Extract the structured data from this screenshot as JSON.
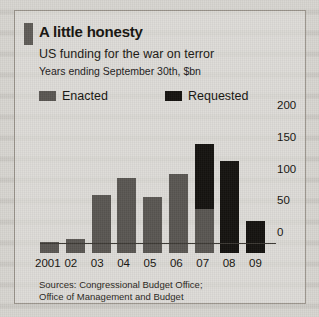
{
  "figure": {
    "title": "A little honesty",
    "subtitle": "US funding for the war on terror",
    "units_note": "Years ending September 30th, $bn",
    "source_line_1": "Sources: Congressional Budget Office;",
    "source_line_2": "Office of Management and Budget",
    "colors": {
      "enacted": "#5a5753",
      "requested": "#151310",
      "panel_background": "#e2e0db",
      "page_background": "#d8d6d1",
      "axis": "#3a3732",
      "text": "#16140f",
      "title_accent": "#5f5c58"
    }
  },
  "legend": {
    "position": "top-left",
    "items": [
      {
        "label": "Enacted",
        "color": "#5a5753",
        "swatch_icon": "legend-swatch-enacted"
      },
      {
        "label": "Requested",
        "color": "#151310",
        "swatch_icon": "legend-swatch-requested"
      }
    ]
  },
  "chart_data": {
    "type": "bar",
    "title": "A little honesty",
    "subtitle": "US funding for the war on terror",
    "xlabel": "",
    "ylabel": "$bn",
    "ylim": [
      0,
      200
    ],
    "yticks": [
      0,
      50,
      100,
      150,
      200
    ],
    "ytick_labels": [
      "0",
      "50",
      "100",
      "150",
      "200"
    ],
    "y_axis_side": "right",
    "grid": false,
    "stacked": true,
    "categories": [
      "2001",
      "02",
      "03",
      "04",
      "05",
      "06",
      "07",
      "08",
      "09"
    ],
    "series": [
      {
        "name": "Enacted",
        "color": "#5a5753",
        "values": [
          17,
          22,
          92,
          118,
          88,
          125,
          70,
          0,
          0
        ]
      },
      {
        "name": "Requested",
        "color": "#151310",
        "values": [
          0,
          0,
          0,
          0,
          0,
          0,
          102,
          145,
          50
        ]
      }
    ],
    "totals": [
      17,
      22,
      92,
      118,
      88,
      125,
      172,
      145,
      50
    ],
    "annotations": []
  }
}
